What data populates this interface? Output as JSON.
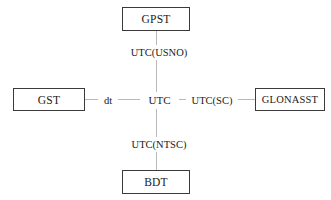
{
  "diagram": {
    "type": "node-link",
    "style": {
      "box_border_color": "#3a3a3a",
      "line_color": "#b9b9b9",
      "text_color": "#1a1a1a",
      "background": "#ffffff"
    },
    "nodes": [
      {
        "id": "gpst",
        "label": "GPST",
        "position": "top"
      },
      {
        "id": "gst",
        "label": "GST",
        "position": "left"
      },
      {
        "id": "utc",
        "label": "UTC",
        "position": "center"
      },
      {
        "id": "glonasst",
        "label": "GLONASST",
        "position": "right"
      },
      {
        "id": "bdt",
        "label": "BDT",
        "position": "bottom"
      }
    ],
    "edges": [
      {
        "id": "gpst-utc",
        "from": "gpst",
        "to": "utc",
        "label": "UTC(USNO)"
      },
      {
        "id": "bdt-utc",
        "from": "bdt",
        "to": "utc",
        "label": "UTC(NTSC)"
      },
      {
        "id": "gst-utc",
        "from": "gst",
        "to": "utc",
        "label": "dt"
      },
      {
        "id": "utc-glonasst",
        "from": "utc",
        "to": "glonasst",
        "label": "UTC(SC)"
      }
    ]
  }
}
